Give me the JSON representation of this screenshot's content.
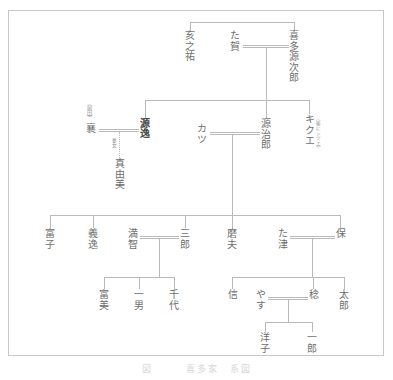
{
  "figure": {
    "kind": "family-tree",
    "caption": "図　　　喜多家　系図",
    "frame_color": "#c8c8c8",
    "line_color": "#b9b9b9",
    "text_color": "#6e6e6e"
  },
  "generations": [
    {
      "level": 1,
      "people": [
        {
          "id": "inosuke",
          "name": "亥之祐",
          "note": ""
        },
        {
          "id": "taga",
          "name": "た賀",
          "note": ""
        },
        {
          "id": "kitagenjiro",
          "name": "喜多源次郎",
          "note": ""
        }
      ],
      "marriages": [
        {
          "left": "taga",
          "right": "kitagenjiro"
        }
      ],
      "siblings": [
        "inosuke",
        "kitagenjiro"
      ]
    },
    {
      "level": 2,
      "people": [
        {
          "id": "maeda-susumu",
          "name": "襄",
          "note": "（前田）"
        },
        {
          "id": "genitsu",
          "name": "源逸",
          "note": "",
          "emphasis": true
        },
        {
          "id": "katsu",
          "name": "カツ",
          "note": ""
        },
        {
          "id": "genjiro",
          "name": "源治郎",
          "note": ""
        },
        {
          "id": "kikue",
          "name": "キクエ",
          "note": "（後にシヅエ）"
        }
      ],
      "marriages": [
        {
          "left": "maeda-susumu",
          "right": "genitsu"
        },
        {
          "left": "katsu",
          "right": "genjiro"
        }
      ],
      "siblings": [
        "genitsu",
        "genjiro",
        "kikue"
      ]
    },
    {
      "level": 3,
      "people": [
        {
          "id": "mayumi",
          "name": "真由美",
          "note": "養女"
        }
      ]
    },
    {
      "level": 4,
      "people": [
        {
          "id": "tomiko",
          "name": "富子",
          "note": ""
        },
        {
          "id": "yoshitsugu",
          "name": "義逸",
          "note": ""
        },
        {
          "id": "michi",
          "name": "満智",
          "note": ""
        },
        {
          "id": "saburo",
          "name": "三郎",
          "note": ""
        },
        {
          "id": "mao",
          "name": "磨夫",
          "note": ""
        },
        {
          "id": "tatsu",
          "name": "た津",
          "note": ""
        },
        {
          "id": "tamotsu",
          "name": "保",
          "note": ""
        }
      ],
      "marriages": [
        {
          "left": "michi",
          "right": "saburo"
        },
        {
          "left": "tatsu",
          "right": "tamotsu"
        }
      ],
      "siblings": [
        "tomiko",
        "yoshitsugu",
        "saburo",
        "mao",
        "tamotsu"
      ]
    },
    {
      "level": 5,
      "people": [
        {
          "id": "fumi",
          "name": "富美",
          "note": ""
        },
        {
          "id": "kazuo",
          "name": "一男",
          "note": ""
        },
        {
          "id": "chiyo",
          "name": "千代",
          "note": ""
        },
        {
          "id": "shin",
          "name": "信",
          "note": ""
        },
        {
          "id": "yasu",
          "name": "やす",
          "note": ""
        },
        {
          "id": "minoru",
          "name": "稔",
          "note": ""
        },
        {
          "id": "taro",
          "name": "太郎",
          "note": ""
        }
      ],
      "marriages": [
        {
          "left": "yasu",
          "right": "minoru"
        }
      ],
      "siblings": [
        [
          "fumi",
          "kazuo",
          "chiyo"
        ],
        [
          "shin",
          "minoru",
          "taro"
        ]
      ]
    },
    {
      "level": 6,
      "people": [
        {
          "id": "yoko",
          "name": "洋子",
          "note": ""
        },
        {
          "id": "ichiro",
          "name": "一郎",
          "note": ""
        }
      ],
      "siblings": [
        "yoko",
        "ichiro"
      ]
    }
  ]
}
